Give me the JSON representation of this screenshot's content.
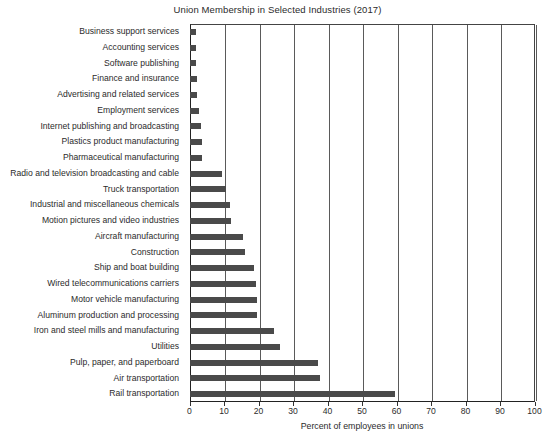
{
  "chart_data": {
    "type": "bar",
    "orientation": "horizontal",
    "title": "Union Membership in Selected Industries (2017)",
    "xlabel": "Percent of employees in unions",
    "ylabel": "",
    "xlim": [
      0,
      100
    ],
    "xticks": [
      0,
      10,
      20,
      30,
      40,
      50,
      60,
      70,
      80,
      90,
      100
    ],
    "xtick_labels": [
      "0",
      "10",
      "20",
      "30",
      "40",
      "50",
      "60",
      "70",
      "80",
      "90",
      "100"
    ],
    "grid": "vertical",
    "legend": "none",
    "bar_color": "#4a4a4a",
    "categories": [
      "Business support services",
      "Accounting services",
      "Software publishing",
      "Finance and insurance",
      "Advertising and related services",
      "Employment services",
      "Internet publishing and broadcasting",
      "Plastics product manufacturing",
      "Pharmaceutical manufacturing",
      "Radio and television broadcasting and cable",
      "Truck transportation",
      "Industrial and miscellaneous chemicals",
      "Motion pictures and video industries",
      "Aircraft manufacturing",
      "Construction",
      "Ship and boat building",
      "Wired telecommunications carriers",
      "Motor vehicle manufacturing",
      "Aluminum production and processing",
      "Iron and steel mills and manufacturing",
      "Utilities",
      "Pulp, paper, and paperboard",
      "Air transportation",
      "Rail transportation"
    ],
    "values": [
      1.8,
      1.9,
      2.0,
      2.2,
      2.3,
      2.8,
      3.2,
      3.6,
      3.6,
      9.4,
      10.5,
      11.6,
      11.9,
      15.6,
      16.2,
      18.8,
      19.3,
      19.6,
      19.7,
      24.5,
      26.2,
      37.2,
      37.9,
      59.5
    ]
  }
}
